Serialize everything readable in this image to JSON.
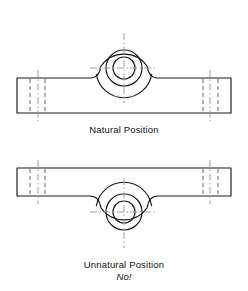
{
  "page": {
    "width": 248,
    "height": 291,
    "background": "#ffffff"
  },
  "colors": {
    "object_line": "#1a1a1a",
    "hidden_line": "#6e6e6e",
    "center_line": "#9a9a9a",
    "text": "#111111",
    "background": "#ffffff"
  },
  "captions": {
    "natural": "Natural Position",
    "unnatural": "Unnatural Position",
    "no": "No!"
  },
  "figures": [
    {
      "id": "natural-position",
      "label": "Natural Position",
      "boss_direction": "up",
      "center": {
        "x": 124,
        "y": 68
      },
      "circles": [
        {
          "name": "outer-boss-arc",
          "radius": 28
        },
        {
          "name": "middle-circle",
          "radius": 18
        },
        {
          "name": "inner-bore-circle",
          "radius": 11
        }
      ],
      "plate": {
        "left": 17,
        "right": 231,
        "top": 78,
        "bottom": 113
      },
      "centerlines": {
        "horizontal": {
          "x1": 90,
          "x2": 158,
          "y": 68
        },
        "vertical": {
          "y1": 33,
          "y2": 103,
          "x": 124
        }
      },
      "hidden_lines": [
        {
          "x": 30,
          "y1": 80,
          "y2": 111
        },
        {
          "x": 45,
          "y1": 80,
          "y2": 111
        },
        {
          "x": 203,
          "y1": 80,
          "y2": 111
        },
        {
          "x": 218,
          "y1": 80,
          "y2": 111
        }
      ],
      "bolt_centerlines": [
        {
          "x": 38,
          "y1": 70,
          "y2": 121
        },
        {
          "x": 210,
          "y1": 70,
          "y2": 121
        }
      ]
    },
    {
      "id": "unnatural-position",
      "label": "Unnatural Position",
      "boss_direction": "down",
      "center": {
        "x": 124,
        "y": 212
      },
      "circles": [
        {
          "name": "outer-boss-arc",
          "radius": 28
        },
        {
          "name": "middle-circle",
          "radius": 18
        },
        {
          "name": "inner-bore-circle",
          "radius": 11
        }
      ],
      "plate": {
        "left": 17,
        "right": 231,
        "top": 168,
        "bottom": 196
      },
      "centerlines": {
        "horizontal": {
          "x1": 90,
          "x2": 158,
          "y": 212
        },
        "vertical": {
          "y1": 178,
          "y2": 248,
          "x": 124
        }
      },
      "hidden_lines": [
        {
          "x": 30,
          "y1": 170,
          "y2": 194
        },
        {
          "x": 45,
          "y1": 170,
          "y2": 194
        },
        {
          "x": 203,
          "y1": 170,
          "y2": 194
        },
        {
          "x": 218,
          "y1": 170,
          "y2": 194
        }
      ],
      "bolt_centerlines": [
        {
          "x": 38,
          "y1": 160,
          "y2": 204
        },
        {
          "x": 210,
          "y1": 160,
          "y2": 204
        }
      ]
    }
  ]
}
